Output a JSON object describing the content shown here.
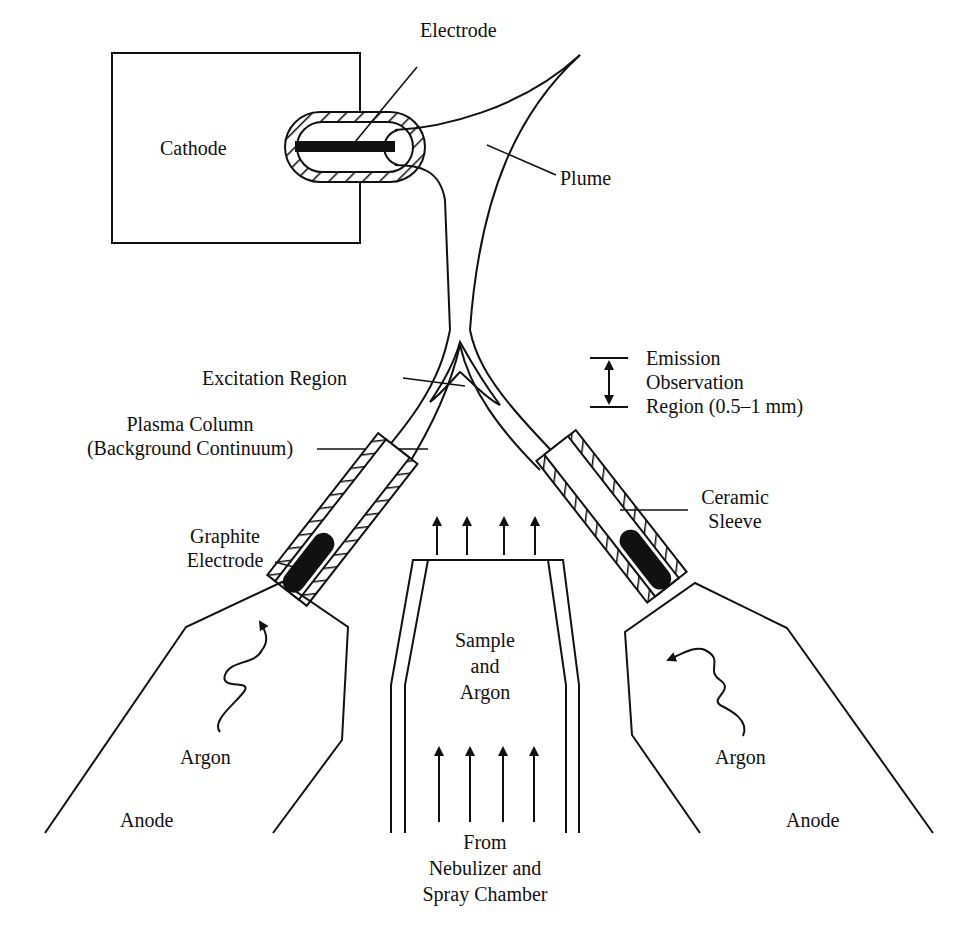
{
  "figure": {
    "labels": {
      "electrode": "Electrode",
      "cathode": "Cathode",
      "plume": "Plume",
      "excitation_region": "Excitation Region",
      "emission_line1": "Emission",
      "emission_line2": "Observation",
      "emission_line3": "Region (0.5–1 mm)",
      "plasma_column_line1": "Plasma Column",
      "plasma_column_line2": "(Background Continuum)",
      "ceramic_sleeve_line1": "Ceramic",
      "ceramic_sleeve_line2": "Sleeve",
      "graphite_electrode_line1": "Graphite",
      "graphite_electrode_line2": "Electrode",
      "sample_line1": "Sample",
      "sample_line2": "and",
      "sample_line3": "Argon",
      "argon_left": "Argon",
      "argon_right": "Argon",
      "anode_left": "Anode",
      "anode_right": "Anode",
      "source_line1": "From",
      "source_line2": "Nebulizer and",
      "source_line3": "Spray Chamber"
    },
    "colors": {
      "ink": "#111111",
      "background": "#ffffff"
    }
  }
}
